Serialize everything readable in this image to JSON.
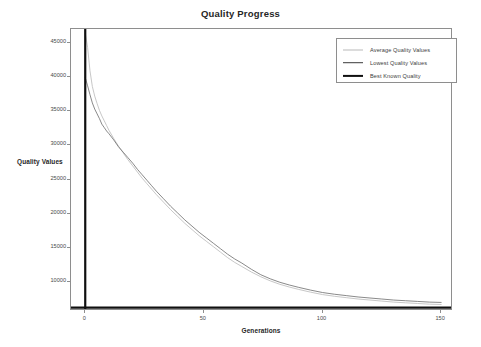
{
  "chart_data": {
    "type": "line",
    "title": "Quality Progress",
    "xlabel": "Generations",
    "ylabel": "Quality Values",
    "xlim": [
      -6,
      155
    ],
    "ylim": [
      5800,
      47000
    ],
    "xticks": [
      0,
      50,
      100,
      150
    ],
    "yticks": [
      10000,
      15000,
      20000,
      25000,
      30000,
      35000,
      40000,
      45000
    ],
    "grid": false,
    "legend_position": "upper right",
    "legend": [
      "Average Quality Values",
      "Lowest Quality Values",
      "Best Known Quality"
    ],
    "series": [
      {
        "name": "Average Quality Values",
        "color": "#b9b9b9",
        "linewidth": 0.8,
        "x": [
          0,
          1,
          2,
          3,
          4,
          5,
          6,
          7,
          8,
          9,
          10,
          12,
          14,
          16,
          18,
          20,
          22,
          24,
          26,
          28,
          30,
          33,
          36,
          39,
          42,
          45,
          48,
          51,
          54,
          57,
          60,
          63,
          66,
          70,
          74,
          78,
          82,
          86,
          90,
          95,
          100,
          105,
          110,
          115,
          120,
          125,
          130,
          135,
          140,
          145,
          150
        ],
        "values": [
          46400,
          44300,
          40900,
          38600,
          37200,
          36100,
          35100,
          34300,
          33600,
          32900,
          32200,
          31000,
          29900,
          28900,
          27900,
          27000,
          26100,
          25200,
          24400,
          23600,
          22800,
          21700,
          20600,
          19600,
          18600,
          17700,
          16800,
          16000,
          15200,
          14400,
          13600,
          12900,
          12300,
          11500,
          10800,
          10200,
          9700,
          9300,
          8950,
          8550,
          8200,
          7950,
          7750,
          7550,
          7400,
          7250,
          7100,
          7000,
          6900,
          6800,
          6750
        ]
      },
      {
        "name": "Lowest Quality Values",
        "color": "#6b6b6b",
        "linewidth": 0.8,
        "x": [
          0,
          1,
          2,
          3,
          4,
          5,
          6,
          7,
          8,
          9,
          10,
          12,
          14,
          16,
          18,
          20,
          22,
          24,
          26,
          28,
          30,
          33,
          36,
          39,
          42,
          45,
          48,
          51,
          54,
          57,
          60,
          63,
          66,
          70,
          74,
          78,
          82,
          86,
          90,
          95,
          100,
          105,
          110,
          115,
          120,
          125,
          130,
          135,
          140,
          145,
          150
        ],
        "values": [
          39900,
          38700,
          37400,
          36200,
          35300,
          34600,
          33900,
          33100,
          32600,
          32100,
          31700,
          30800,
          29800,
          29000,
          28200,
          27400,
          26500,
          25700,
          24900,
          24100,
          23300,
          22200,
          21100,
          20100,
          19100,
          18200,
          17300,
          16500,
          15700,
          14900,
          14100,
          13400,
          12800,
          11900,
          11100,
          10500,
          10000,
          9600,
          9250,
          8850,
          8500,
          8250,
          8050,
          7850,
          7700,
          7550,
          7400,
          7300,
          7200,
          7100,
          7050
        ]
      },
      {
        "name": "Best Known Quality",
        "color": "#101010",
        "linewidth": 2.2,
        "type": "hline",
        "value": 6300
      }
    ],
    "annotations": {
      "start_marker": {
        "name": "generation-zero-marker",
        "x": 0,
        "color": "#101010",
        "linewidth": 2.2
      }
    }
  },
  "axes": {
    "y_tick_labels": [
      "45000",
      "40000",
      "35000",
      "30000",
      "25000",
      "20000",
      "15000",
      "10000"
    ],
    "x_tick_labels": [
      "0",
      "50",
      "100",
      "150"
    ]
  }
}
